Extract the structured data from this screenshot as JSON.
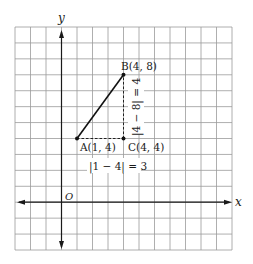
{
  "diagram": {
    "type": "coordinate-plane",
    "axes": {
      "x_label": "x",
      "y_label": "y",
      "origin_label": "O"
    },
    "grid": {
      "columns": 14,
      "rows": 14,
      "origin_column": 3,
      "origin_row_from_top": 11,
      "x_range": [
        -3,
        11
      ],
      "y_range": [
        -3,
        11
      ]
    },
    "points": [
      {
        "name": "A",
        "label": "A(1, 4)",
        "x": 1,
        "y": 4
      },
      {
        "name": "B",
        "label": "B(4, 8)",
        "x": 4,
        "y": 8
      },
      {
        "name": "C",
        "label": "C(4, 4)",
        "x": 4,
        "y": 4
      }
    ],
    "segments": [
      {
        "from": "A",
        "to": "B",
        "style": "solid"
      },
      {
        "from": "A",
        "to": "C",
        "style": "dashed"
      },
      {
        "from": "C",
        "to": "B",
        "style": "dashed"
      }
    ],
    "annotations": {
      "horizontal_distance": "|1 − 4| = 3",
      "vertical_distance": "|4 − 8| = 4"
    },
    "colors": {
      "grid": "#9a9a9a",
      "axis": "#1a1a1a",
      "segment": "#111111",
      "background": "#ffffff"
    }
  }
}
